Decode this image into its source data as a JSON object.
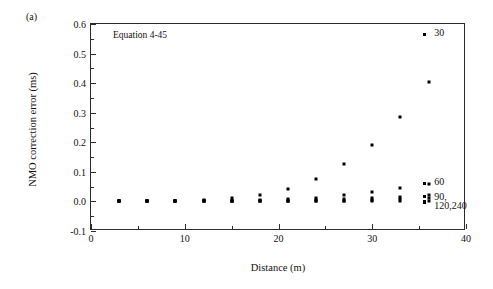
{
  "figure": {
    "panel_label": "(a)",
    "annotation": "Equation 4-45"
  },
  "chart_data": {
    "type": "scatter",
    "title": "",
    "xlabel": "Distance (m)",
    "ylabel": "NMO correction error (ms)",
    "xlim": [
      0,
      40
    ],
    "ylim": [
      -0.1,
      0.6
    ],
    "xticks": [
      0,
      10,
      20,
      30,
      40
    ],
    "xtick_labels": [
      "0",
      "10",
      "20",
      "30",
      "40"
    ],
    "xminor_ticks": [
      5,
      15,
      25,
      35
    ],
    "yticks": [
      -0.1,
      0.0,
      0.1,
      0.2,
      0.3,
      0.4,
      0.5,
      0.6
    ],
    "ytick_labels": [
      "-0.1",
      "0.0",
      "0.1",
      "0.2",
      "0.3",
      "0.4",
      "0.5",
      "0.6"
    ],
    "yminor_ticks": [
      -0.05,
      0.05,
      0.15,
      0.25,
      0.35,
      0.45,
      0.55
    ],
    "grid": false,
    "legend_position": "right-inside",
    "x": [
      3,
      6,
      9,
      12,
      15,
      18,
      21,
      24,
      27,
      30,
      33,
      36
    ],
    "series": [
      {
        "name": "30",
        "label": "30",
        "values": [
          0.0,
          0.0,
          0.002,
          0.005,
          0.011,
          0.022,
          0.042,
          0.076,
          0.125,
          0.19,
          0.285,
          0.405
        ]
      },
      {
        "name": "60",
        "label": "60",
        "values": [
          0.0,
          0.0,
          0.0,
          0.001,
          0.002,
          0.004,
          0.008,
          0.013,
          0.021,
          0.031,
          0.044,
          0.06
        ]
      },
      {
        "name": "90",
        "label": "90, 120,240",
        "values": [
          0.0,
          0.0,
          0.0,
          0.0,
          0.0,
          0.001,
          0.002,
          0.004,
          0.007,
          0.011,
          0.016,
          0.022
        ]
      },
      {
        "name": "120",
        "label": "",
        "values": [
          0.0,
          0.0,
          0.0,
          0.0,
          0.0,
          0.0,
          0.001,
          0.002,
          0.003,
          0.005,
          0.008,
          0.011
        ]
      },
      {
        "name": "240",
        "label": "",
        "values": [
          0.0,
          0.0,
          0.0,
          0.0,
          0.0,
          0.0,
          0.0,
          0.0,
          0.0,
          0.0,
          0.001,
          0.002
        ]
      }
    ],
    "legend": [
      {
        "label": "30",
        "x": 36.6,
        "y": 0.565,
        "marker": "single"
      },
      {
        "label": "60",
        "x": 36.6,
        "y": 0.062,
        "marker": "single"
      },
      {
        "label": "90,",
        "x": 36.6,
        "y": 0.012,
        "marker": "stack"
      },
      {
        "label": "120,240",
        "x": 36.6,
        "y": -0.018,
        "marker": "none"
      }
    ]
  }
}
